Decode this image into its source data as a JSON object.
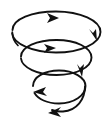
{
  "figure": {
    "alt_text": "A black line-art conical spiral drawn as three nested ellipses that shrink as they descend, with six solid triangular arrowheads showing clockwise downward circulation",
    "shape_kind": "conical-spiral",
    "rotation_direction": "clockwise-descending",
    "background_color": "#ffffff",
    "stroke_color": "#111111",
    "arrow_fill_color": "#111111",
    "canvas": {
      "width": 108,
      "height": 121
    },
    "coil_count": 3,
    "arrow_count": 6
  },
  "coils": [
    {
      "name": "coil-1-outer-top",
      "label": "Outer top coil",
      "center_x": 56,
      "center_y": 33,
      "radius_x": 45,
      "radius_y": 19,
      "stroke_width": 1.9,
      "path": "M 12.5 30 C 12.5 19.0 32.0 11.5 56.0 11.5 C 80.0 11.5 100.5 20.5 100.5 32.0 C 100.5 43.5 80.0 52.5 56.0 52.5 C 33.0 52.5 13.5 44.0 12.2 33.5"
    },
    {
      "name": "coil-2-middle",
      "label": "Middle coil",
      "center_x": 56,
      "center_y": 58,
      "radius_x": 36,
      "radius_y": 16,
      "stroke_width": 1.9,
      "path": "M 21.0 56.5 C 21.0 47.0 37.0 40.0 56.5 40.0 C 76.0 40.0 91.5 47.5 91.5 57.5 C 91.5 67.5 76.0 75.0 56.5 75.0 C 37.5 75.0 22.0 67.5 21.0 58.5"
    },
    {
      "name": "coil-3-inner-bottom",
      "label": "Inner bottom coil",
      "center_x": 58,
      "center_y": 85,
      "radius_x": 27,
      "radius_y": 14,
      "stroke_width": 1.9,
      "path": "M 33.0 86.0 C 33.0 77.0 44.5 70.5 59.0 70.5 C 73.5 70.5 85.5 77.5 85.5 86.0 C 85.5 95.5 74.0 103.5 59.0 103.5 C 47.0 103.5 38.0 99.0 34.5 93.0"
    },
    {
      "name": "coil-4-tail",
      "label": "Descending tail",
      "center_x": 62,
      "center_y": 100,
      "radius_x": 22,
      "radius_y": 12,
      "stroke_width": 1.9,
      "path": "M 85.0 86.5 C 85.0 99.0 77.0 110.5 63.0 111.5 C 58.5 111.8 55.0 111.2 52.0 110.0"
    },
    {
      "name": "coil-5-left-wisp",
      "label": "Left open wisp",
      "center_x": 20,
      "center_y": 40,
      "radius_x": 10,
      "radius_y": 14,
      "stroke_width": 1.7,
      "path": "M 12.3 32.0 C 12.3 37.5 14.5 42.0 18.0 45.5"
    }
  ],
  "arrows": [
    {
      "name": "arrow-top-center-right",
      "label": "Top coil arrowhead pointing right",
      "direction": "right",
      "tip_x": 59,
      "tip_y": 18,
      "size": 11,
      "angle_deg": 8,
      "points": "59,18 47,13 50,18 47,23"
    },
    {
      "name": "arrow-upper-right-down",
      "label": "Upper right arrowhead pointing down-right",
      "direction": "down-right",
      "tip_x": 97,
      "tip_y": 41,
      "size": 12,
      "angle_deg": 72,
      "points": "97,41 89,29 93,33 96,29"
    },
    {
      "name": "arrow-middle-center-right",
      "label": "Middle coil arrowhead pointing right",
      "direction": "right",
      "tip_x": 56,
      "tip_y": 48,
      "size": 11,
      "angle_deg": 5,
      "points": "56,48 44,44 47,48 44,53"
    },
    {
      "name": "arrow-middle-right-down",
      "label": "Middle right arrowhead pointing down",
      "direction": "down",
      "tip_x": 82,
      "tip_y": 77,
      "size": 12,
      "angle_deg": 88,
      "points": "82,77 77,64 80,68 84,64"
    },
    {
      "name": "arrow-lower-left-left",
      "label": "Lower left arrowhead pointing left",
      "direction": "left",
      "tip_x": 33,
      "tip_y": 92,
      "size": 12,
      "angle_deg": 192,
      "points": "33,92 46,87 43,92 47,96"
    },
    {
      "name": "arrow-bottom-left",
      "label": "Bottom tail arrowhead pointing left",
      "direction": "left",
      "tip_x": 48,
      "tip_y": 113,
      "size": 12,
      "angle_deg": 186,
      "points": "48,113 61,107 57,112 61,117"
    }
  ]
}
